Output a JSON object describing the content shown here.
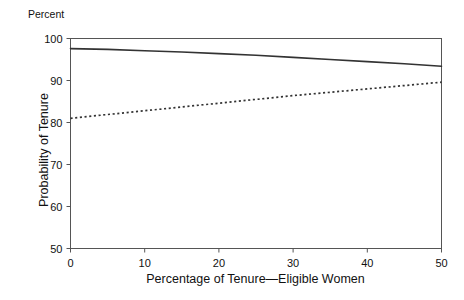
{
  "chart_data": {
    "type": "line",
    "title": "",
    "unit_label": "Percent",
    "xlabel": "Percentage of Tenure—Eligible Women",
    "ylabel": "Probability of Tenure",
    "xlim": [
      0,
      50
    ],
    "ylim": [
      50,
      100
    ],
    "xticks": [
      0,
      10,
      20,
      30,
      40,
      50
    ],
    "yticks": [
      50,
      60,
      70,
      80,
      90,
      100
    ],
    "xtick_labels": [
      "0",
      "10",
      "20",
      "30",
      "40",
      "50"
    ],
    "ytick_labels": [
      "50",
      "60",
      "70",
      "80",
      "90",
      "100"
    ],
    "grid": false,
    "legend": "none",
    "frame": "box",
    "x": [
      0,
      5,
      10,
      15,
      20,
      25,
      30,
      35,
      40,
      45,
      50
    ],
    "series": [
      {
        "name": "solid-line",
        "style": "solid",
        "color": "#333333",
        "values": [
          97.6,
          97.4,
          97.1,
          96.8,
          96.4,
          96.0,
          95.5,
          95.0,
          94.5,
          94.0,
          93.4
        ]
      },
      {
        "name": "dotted-line",
        "style": "dotted",
        "color": "#333333",
        "values": [
          81.0,
          81.9,
          82.8,
          83.7,
          84.6,
          85.5,
          86.4,
          87.2,
          88.0,
          88.8,
          89.6
        ]
      }
    ]
  },
  "axes": {
    "unit_label": "Percent",
    "x_title": "Percentage of Tenure—Eligible Women",
    "y_title": "Probability of Tenure"
  }
}
